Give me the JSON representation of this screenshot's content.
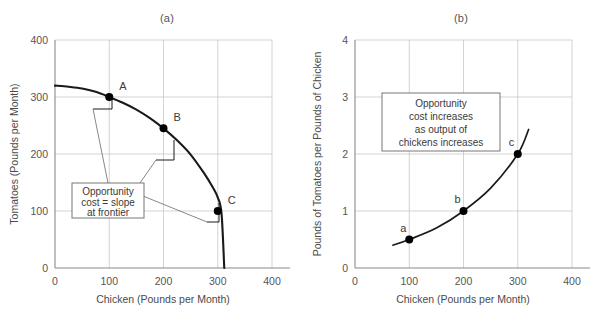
{
  "figure": {
    "panel_a_title": "(a)",
    "panel_b_title": "(b)"
  },
  "panel_a": {
    "xlabel": "Chicken (Pounds per Month)",
    "ylabel": "Tomatoes (Pounds per Month)",
    "xticks": [
      "0",
      "100",
      "200",
      "300",
      "400"
    ],
    "yticks": [
      "0",
      "100",
      "200",
      "300",
      "400"
    ],
    "callout": {
      "line1": "Opportunity",
      "line2": "cost = slope",
      "line3": "at frontier"
    },
    "points": [
      {
        "label": "A"
      },
      {
        "label": "B"
      },
      {
        "label": "C"
      }
    ]
  },
  "panel_b": {
    "xlabel": "Chicken (Pounds per Month)",
    "ylabel": "Pounds of Tomatoes per Pounds of  Chicken",
    "xticks": [
      "0",
      "100",
      "200",
      "300",
      "400"
    ],
    "yticks": [
      "0",
      "1",
      "2",
      "3",
      "4"
    ],
    "callout": {
      "line1": "Opportunity",
      "line2": "cost increases",
      "line3": "as output of",
      "line4": "chickens increases"
    },
    "points": [
      {
        "label": "a"
      },
      {
        "label": "b"
      },
      {
        "label": "c"
      }
    ]
  },
  "chart_data": [
    {
      "type": "line",
      "title": "(a)",
      "xlabel": "Chicken (Pounds per Month)",
      "ylabel": "Tomatoes (Pounds per Month)",
      "xlim": [
        0,
        400
      ],
      "ylim": [
        0,
        400
      ],
      "xticks": [
        0,
        100,
        200,
        300,
        400
      ],
      "yticks": [
        0,
        100,
        200,
        300,
        400
      ],
      "grid": true,
      "legend": "none",
      "series": [
        {
          "name": "Production possibilities frontier",
          "x": [
            0,
            25,
            50,
            75,
            100,
            125,
            150,
            175,
            200,
            225,
            250,
            275,
            290,
            300,
            307,
            312
          ],
          "y": [
            320,
            318,
            315,
            309,
            300,
            290,
            278,
            263,
            245,
            224,
            199,
            166,
            143,
            124,
            95,
            0
          ]
        }
      ],
      "annotations": [
        {
          "label": "A",
          "x": 100,
          "y": 300
        },
        {
          "label": "B",
          "x": 200,
          "y": 245
        },
        {
          "label": "C",
          "x": 300,
          "y": 100
        },
        {
          "text": "Opportunity cost = slope at frontier",
          "x": 95,
          "y": 150
        }
      ]
    },
    {
      "type": "line",
      "title": "(b)",
      "xlabel": "Chicken (Pounds per Month)",
      "ylabel": "Pounds of Tomatoes per Pounds of  Chicken",
      "xlim": [
        0,
        400
      ],
      "ylim": [
        0,
        4
      ],
      "xticks": [
        0,
        100,
        200,
        300,
        400
      ],
      "yticks": [
        0,
        1,
        2,
        3,
        4
      ],
      "grid": true,
      "legend": "none",
      "series": [
        {
          "name": "Opportunity cost of chicken",
          "x": [
            70,
            100,
            150,
            200,
            250,
            300,
            320
          ],
          "y": [
            0.4,
            0.5,
            0.7,
            1.0,
            1.4,
            2.0,
            2.43
          ]
        }
      ],
      "annotations": [
        {
          "label": "a",
          "x": 100,
          "y": 0.5
        },
        {
          "label": "b",
          "x": 200,
          "y": 1.0
        },
        {
          "label": "c",
          "x": 300,
          "y": 2.0
        },
        {
          "text": "Opportunity cost increases as output of chickens increases",
          "x": 200,
          "y": 2.55
        }
      ]
    }
  ]
}
